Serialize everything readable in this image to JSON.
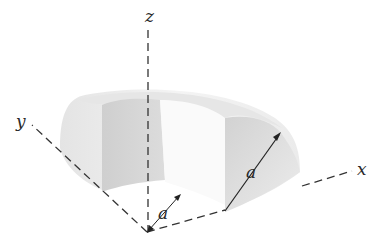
{
  "figure": {
    "axes": {
      "x_label": "x",
      "y_label": "y",
      "z_label": "z"
    },
    "dimensions": {
      "inner_radius_label": "a",
      "thickness_label": "a"
    },
    "colors": {
      "axis": "#333333",
      "outer_surface": "#ececec",
      "inner_surface": "#d4d4d4",
      "end_face": "#dadada",
      "text": "#2a2a2a"
    }
  }
}
